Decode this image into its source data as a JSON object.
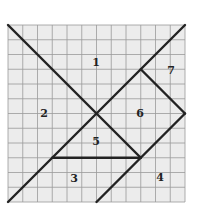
{
  "diagram": {
    "type": "tangram-on-grid",
    "grid": {
      "cells": 12,
      "origin": [
        8,
        25
      ],
      "cell_px": 14.75,
      "line_color": "#9a9a9a",
      "bg_color": "#ececec"
    },
    "stroke_color": "#222222",
    "segments": [
      {
        "from": [
          0,
          0
        ],
        "to": [
          9,
          9
        ]
      },
      {
        "from": [
          0,
          12
        ],
        "to": [
          12,
          0
        ]
      },
      {
        "from": [
          9,
          3
        ],
        "to": [
          12,
          6
        ]
      },
      {
        "from": [
          12,
          6
        ],
        "to": [
          6,
          12
        ]
      },
      {
        "from": [
          3,
          9
        ],
        "to": [
          9,
          9
        ]
      }
    ],
    "labels": [
      {
        "text": "1",
        "x": 96,
        "y": 66
      },
      {
        "text": "2",
        "x": 44,
        "y": 117
      },
      {
        "text": "3",
        "x": 74,
        "y": 182
      },
      {
        "text": "4",
        "x": 160,
        "y": 181
      },
      {
        "text": "5",
        "x": 96,
        "y": 145
      },
      {
        "text": "6",
        "x": 140,
        "y": 117
      },
      {
        "text": "7",
        "x": 171,
        "y": 74
      }
    ]
  }
}
